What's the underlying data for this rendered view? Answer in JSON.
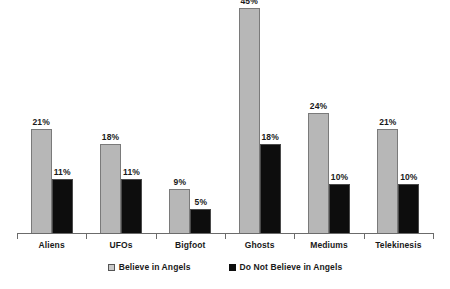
{
  "chart_data": {
    "type": "bar",
    "title": "",
    "subtitle": "",
    "xlabel": "",
    "ylabel": "",
    "grid": false,
    "legend_position": "bottom",
    "ylim": [
      0,
      45
    ],
    "categories": [
      "Aliens",
      "UFOs",
      "Bigfoot",
      "Ghosts",
      "Mediums",
      "Telekinesis"
    ],
    "series": [
      {
        "name": "Believe in Angels",
        "color": "#b7b7b7",
        "values": [
          21,
          18,
          9,
          45,
          24,
          21
        ],
        "value_labels": [
          "21%",
          "18%",
          "9%",
          "45%",
          "24%",
          "21%"
        ]
      },
      {
        "name": "Do Not Believe in Angels",
        "color": "#0d0d0d",
        "values": [
          11,
          11,
          5,
          18,
          10,
          10
        ],
        "value_labels": [
          "11%",
          "11%",
          "5%",
          "18%",
          "10%",
          "10%"
        ]
      }
    ]
  },
  "legend": {
    "items": [
      {
        "label": "Believe in Angels",
        "swatch": "legend-swatch-light"
      },
      {
        "label": "Do Not Believe in Angels",
        "swatch": "legend-swatch-dark"
      }
    ]
  },
  "axis": {
    "baseline_color": "#6b6b6b",
    "tick_count": 7
  }
}
